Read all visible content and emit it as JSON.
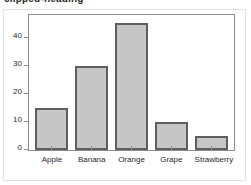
{
  "top_fragment": {
    "text": "clipped-heading"
  },
  "chart_data": {
    "type": "bar",
    "title": "",
    "xlabel": "",
    "ylabel": "",
    "categories": [
      "Apple",
      "Banana",
      "Orange",
      "Grape",
      "Strawberry"
    ],
    "values": [
      15,
      30,
      45,
      10,
      5
    ],
    "ylim": [
      0,
      48
    ],
    "yticks": [
      0,
      10,
      20,
      30,
      40
    ],
    "ytick_labels": [
      "0",
      "10",
      "20",
      "30",
      "40"
    ],
    "grid": false,
    "legend": null,
    "bar_fill_color": "#c6c6c6",
    "bar_edge_color": "#5e5e5e",
    "axis_color": "#8c8c8c",
    "panel_border_color": "#e2e2e2",
    "background_color": "#ffffff"
  }
}
